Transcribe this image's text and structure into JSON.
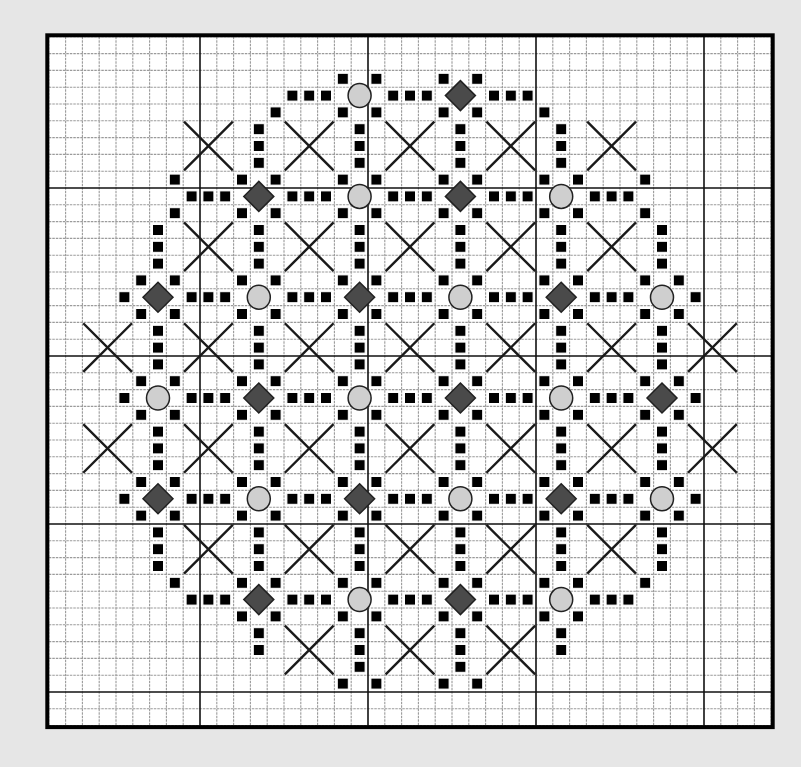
{
  "pattern": {
    "title": "",
    "grid": {
      "origin_x": 48.8,
      "origin_y": 36.8,
      "cell": 16.8,
      "cols": 43,
      "rows": 41,
      "major_every": 10,
      "major_col_offset": 9,
      "major_row_offset": 9
    },
    "colors": {
      "background": "#e6e6e6",
      "paper": "#ffffff",
      "minor_line": "#9a9a9a",
      "major_line": "#111111",
      "border": "#000000",
      "square": "#000000",
      "cross": "#1a1a1a",
      "circle_fill": "#cfcfcf",
      "diamond_fill": "#4a4a4a",
      "symbol_outline": "#222222"
    },
    "legend_symbols": [
      {
        "name": "small-square",
        "glyph": "■"
      },
      {
        "name": "circle",
        "glyph": "●"
      },
      {
        "name": "diamond",
        "glyph": "◆"
      },
      {
        "name": "cross",
        "glyph": "✕"
      }
    ],
    "nodes": [
      {
        "c": 18,
        "r": 3,
        "type": "circle"
      },
      {
        "c": 24,
        "r": 3,
        "type": "diamond"
      },
      {
        "c": 12,
        "r": 9,
        "type": "diamond"
      },
      {
        "c": 18,
        "r": 9,
        "type": "circle"
      },
      {
        "c": 24,
        "r": 9,
        "type": "diamond"
      },
      {
        "c": 30,
        "r": 9,
        "type": "circle"
      },
      {
        "c": 6,
        "r": 15,
        "type": "diamond"
      },
      {
        "c": 12,
        "r": 15,
        "type": "circle"
      },
      {
        "c": 18,
        "r": 15,
        "type": "diamond"
      },
      {
        "c": 24,
        "r": 15,
        "type": "circle"
      },
      {
        "c": 30,
        "r": 15,
        "type": "diamond"
      },
      {
        "c": 36,
        "r": 15,
        "type": "circle"
      },
      {
        "c": 6,
        "r": 21,
        "type": "circle"
      },
      {
        "c": 12,
        "r": 21,
        "type": "diamond"
      },
      {
        "c": 18,
        "r": 21,
        "type": "circle"
      },
      {
        "c": 24,
        "r": 21,
        "type": "diamond"
      },
      {
        "c": 30,
        "r": 21,
        "type": "circle"
      },
      {
        "c": 36,
        "r": 21,
        "type": "diamond"
      },
      {
        "c": 6,
        "r": 27,
        "type": "diamond"
      },
      {
        "c": 12,
        "r": 27,
        "type": "circle"
      },
      {
        "c": 18,
        "r": 27,
        "type": "diamond"
      },
      {
        "c": 24,
        "r": 27,
        "type": "circle"
      },
      {
        "c": 30,
        "r": 27,
        "type": "diamond"
      },
      {
        "c": 36,
        "r": 27,
        "type": "circle"
      },
      {
        "c": 12,
        "r": 33,
        "type": "diamond"
      },
      {
        "c": 18,
        "r": 33,
        "type": "circle"
      },
      {
        "c": 24,
        "r": 33,
        "type": "diamond"
      },
      {
        "c": 30,
        "r": 33,
        "type": "circle"
      }
    ],
    "square_rows": {
      "2": [
        17,
        19,
        23,
        25
      ],
      "3": [
        14,
        15,
        16,
        20,
        21,
        22,
        26,
        27,
        28
      ],
      "4": [
        13,
        17,
        19,
        23,
        25,
        29
      ],
      "5": [
        12,
        18,
        24,
        30
      ],
      "6": [
        12,
        18,
        24,
        30
      ],
      "7": [
        12,
        18,
        24,
        30
      ],
      "8": [
        7,
        11,
        13,
        17,
        19,
        23,
        25,
        29,
        31,
        35
      ],
      "9": [
        8,
        9,
        10,
        14,
        15,
        16,
        20,
        21,
        22,
        26,
        27,
        28,
        32,
        33,
        34
      ],
      "10": [
        7,
        11,
        13,
        17,
        19,
        23,
        25,
        29,
        31,
        35
      ],
      "11": [
        6,
        12,
        18,
        24,
        30,
        36
      ],
      "12": [
        6,
        12,
        18,
        24,
        30,
        36
      ],
      "13": [
        6,
        12,
        18,
        24,
        30,
        36
      ],
      "14": [
        5,
        7,
        11,
        13,
        17,
        19,
        23,
        25,
        29,
        31,
        35,
        37
      ],
      "15": [
        4,
        8,
        9,
        10,
        14,
        15,
        16,
        20,
        21,
        22,
        26,
        27,
        28,
        32,
        33,
        34,
        38
      ],
      "16": [
        5,
        7,
        11,
        13,
        17,
        19,
        23,
        25,
        29,
        31,
        35,
        37
      ],
      "17": [
        6,
        12,
        18,
        24,
        30,
        36
      ],
      "18": [
        6,
        12,
        18,
        24,
        30,
        36
      ],
      "19": [
        6,
        12,
        18,
        24,
        30,
        36
      ],
      "20": [
        5,
        7,
        11,
        13,
        17,
        19,
        23,
        25,
        29,
        31,
        35,
        37
      ],
      "21": [
        4,
        8,
        9,
        10,
        14,
        15,
        16,
        20,
        21,
        22,
        26,
        27,
        28,
        32,
        33,
        34,
        38
      ],
      "22": [
        5,
        7,
        11,
        13,
        17,
        19,
        23,
        25,
        29,
        31,
        35,
        37
      ],
      "23": [
        6,
        12,
        18,
        24,
        30,
        36
      ],
      "24": [
        6,
        12,
        18,
        24,
        30,
        36
      ],
      "25": [
        6,
        12,
        18,
        24,
        30,
        36
      ],
      "26": [
        5,
        7,
        11,
        13,
        17,
        19,
        23,
        25,
        29,
        31,
        35,
        37
      ],
      "27": [
        4,
        8,
        9,
        10,
        14,
        15,
        16,
        20,
        21,
        22,
        26,
        27,
        28,
        32,
        33,
        34,
        38
      ],
      "28": [
        5,
        7,
        11,
        13,
        17,
        19,
        23,
        25,
        29,
        31,
        35,
        37
      ],
      "29": [
        6,
        12,
        18,
        24,
        30,
        36
      ],
      "30": [
        6,
        12,
        18,
        24,
        30,
        36
      ],
      "31": [
        6,
        12,
        18,
        24,
        30,
        36
      ],
      "32": [
        7,
        11,
        13,
        17,
        19,
        23,
        25,
        29,
        31,
        35
      ],
      "33": [
        8,
        9,
        10,
        14,
        15,
        16,
        20,
        21,
        22,
        26,
        27,
        28,
        32,
        33,
        34
      ],
      "34": [
        11,
        13,
        17,
        19,
        23,
        25,
        29,
        31
      ],
      "35": [
        12,
        18,
        24,
        30
      ],
      "36": [
        12,
        18,
        24,
        30
      ],
      "37": [
        18,
        24
      ],
      "38": [
        17,
        19,
        23,
        25
      ]
    },
    "cross_rows": {
      "6": [
        9,
        15,
        21,
        27,
        33
      ],
      "12": [
        9,
        15,
        21,
        27,
        33
      ],
      "18": [
        3,
        9,
        15,
        21,
        27,
        33,
        39
      ],
      "24": [
        3,
        9,
        15,
        21,
        27,
        33,
        39
      ],
      "30": [
        9,
        15,
        21,
        27,
        33
      ],
      "36": [
        15,
        21,
        27
      ]
    }
  }
}
